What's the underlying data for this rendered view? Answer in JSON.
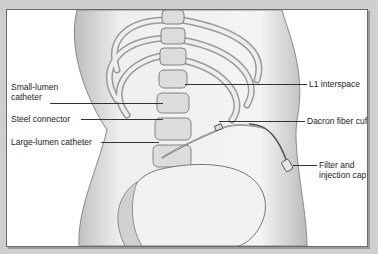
{
  "figure": {
    "labels": {
      "small_lumen_catheter": "Small-lumen catheter",
      "small_lumen_line1": "Small-lumen",
      "small_lumen_line2": "catheter",
      "steel_connector": "Steel connector",
      "large_lumen_catheter": "Large-lumen catheter",
      "l1_interspace": "L1 interspace",
      "dacron_fiber_cuff": "Dacron fiber cuff",
      "filter_line1": "Filter and",
      "filter_line2": "injection cap"
    }
  },
  "colors": {
    "frame": "#cfcfcf",
    "panel": "#ffffff",
    "ink": "#333333"
  }
}
